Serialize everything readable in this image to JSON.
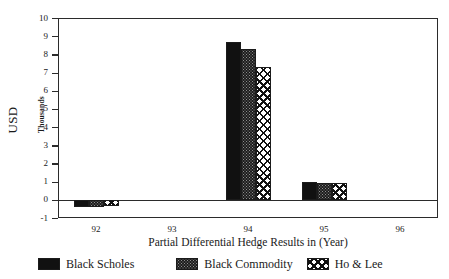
{
  "chart_data": {
    "type": "bar",
    "title": "",
    "xlabel": "Partial Differential Hedge Results in (Year)",
    "ylabel": "USD",
    "ylabel_units": "Thousands",
    "categories": [
      "92",
      "93",
      "94",
      "95",
      "96"
    ],
    "yticks": [
      10,
      9,
      8,
      7,
      6,
      5,
      4,
      3,
      2,
      1,
      0,
      -1
    ],
    "ylim": [
      -1,
      10
    ],
    "grid": false,
    "legend_position": "bottom",
    "series": [
      {
        "name": "Black Scholes",
        "fill": "solid-black",
        "color": "#111111",
        "values": [
          -0.4,
          0,
          8.7,
          1.0,
          0
        ]
      },
      {
        "name": "Black Commodity",
        "fill": "dark-stipple",
        "color": "#1d1d1d",
        "values": [
          -0.4,
          0,
          8.3,
          0.95,
          0
        ]
      },
      {
        "name": "Ho & Lee",
        "fill": "white-diamond-crosshatch",
        "color": "#ffffff",
        "values": [
          -0.35,
          0,
          7.3,
          0.9,
          0
        ]
      }
    ]
  },
  "axis": {
    "ylabel_main": "USD",
    "ylabel_sub": "Thousands",
    "xaxis_title": "Partial Differential Hedge Results in (Year)",
    "ytick_labels": [
      "10",
      "9",
      "8",
      "7",
      "6",
      "5",
      "4",
      "3",
      "2",
      "1",
      "0",
      "-1"
    ],
    "xtick_labels": [
      "92",
      "93",
      "94",
      "95",
      "96"
    ]
  },
  "legend": {
    "items": [
      {
        "label": "Black Scholes"
      },
      {
        "label": "Black Commodity"
      },
      {
        "label": "Ho & Lee"
      }
    ]
  }
}
